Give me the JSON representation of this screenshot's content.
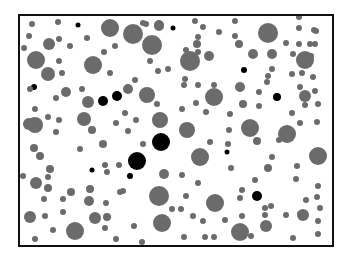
{
  "figure": {
    "frame": {
      "x": 19,
      "y": 15,
      "width": 314,
      "height": 231,
      "stroke": "#111111",
      "stroke_width": 2
    },
    "colors": {
      "gray": "#6b6b6b",
      "black": "#000000",
      "background": "#ffffff"
    },
    "circles": [
      {
        "x": 32,
        "y": 24,
        "r": 3,
        "c": "gray"
      },
      {
        "x": 58,
        "y": 22,
        "r": 3,
        "c": "gray"
      },
      {
        "x": 78,
        "y": 25,
        "r": 2.5,
        "c": "black"
      },
      {
        "x": 110,
        "y": 28,
        "r": 9,
        "c": "gray"
      },
      {
        "x": 133,
        "y": 34,
        "r": 10,
        "c": "gray"
      },
      {
        "x": 146,
        "y": 24,
        "r": 3,
        "c": "gray"
      },
      {
        "x": 159,
        "y": 25,
        "r": 5,
        "c": "gray"
      },
      {
        "x": 173,
        "y": 28,
        "r": 2.5,
        "c": "black"
      },
      {
        "x": 29,
        "y": 36,
        "r": 3,
        "c": "gray"
      },
      {
        "x": 49,
        "y": 44,
        "r": 6,
        "c": "gray"
      },
      {
        "x": 59,
        "y": 39,
        "r": 3,
        "c": "gray"
      },
      {
        "x": 70,
        "y": 46,
        "r": 3,
        "c": "gray"
      },
      {
        "x": 87,
        "y": 38,
        "r": 3,
        "c": "gray"
      },
      {
        "x": 24,
        "y": 48,
        "r": 3,
        "c": "gray"
      },
      {
        "x": 36,
        "y": 60,
        "r": 9,
        "c": "gray"
      },
      {
        "x": 59,
        "y": 61,
        "r": 3,
        "c": "gray"
      },
      {
        "x": 93,
        "y": 65,
        "r": 9,
        "c": "gray"
      },
      {
        "x": 104,
        "y": 52,
        "r": 3,
        "c": "gray"
      },
      {
        "x": 115,
        "y": 46,
        "r": 3,
        "c": "gray"
      },
      {
        "x": 48,
        "y": 74,
        "r": 7,
        "c": "gray"
      },
      {
        "x": 62,
        "y": 73,
        "r": 3,
        "c": "gray"
      },
      {
        "x": 110,
        "y": 73,
        "r": 3,
        "c": "gray"
      },
      {
        "x": 34,
        "y": 87,
        "r": 3,
        "c": "black"
      },
      {
        "x": 30,
        "y": 89,
        "r": 3,
        "c": "gray"
      },
      {
        "x": 66,
        "y": 92,
        "r": 5,
        "c": "gray"
      },
      {
        "x": 82,
        "y": 89,
        "r": 3,
        "c": "gray"
      },
      {
        "x": 56,
        "y": 98,
        "r": 3,
        "c": "gray"
      },
      {
        "x": 88,
        "y": 102,
        "r": 6,
        "c": "gray"
      },
      {
        "x": 103,
        "y": 101,
        "r": 5,
        "c": "black"
      },
      {
        "x": 117,
        "y": 96,
        "r": 5,
        "c": "black"
      },
      {
        "x": 143,
        "y": 23,
        "r": 3,
        "c": "gray"
      },
      {
        "x": 158,
        "y": 71,
        "r": 3,
        "c": "gray"
      },
      {
        "x": 195,
        "y": 21,
        "r": 3,
        "c": "gray"
      },
      {
        "x": 203,
        "y": 27,
        "r": 3,
        "c": "gray"
      },
      {
        "x": 219,
        "y": 32,
        "r": 3,
        "c": "gray"
      },
      {
        "x": 152,
        "y": 45,
        "r": 10,
        "c": "gray"
      },
      {
        "x": 159,
        "y": 26,
        "r": 5,
        "c": "gray"
      },
      {
        "x": 186,
        "y": 50,
        "r": 3,
        "c": "gray"
      },
      {
        "x": 198,
        "y": 52,
        "r": 3,
        "c": "gray"
      },
      {
        "x": 198,
        "y": 37,
        "r": 3,
        "c": "gray"
      },
      {
        "x": 197,
        "y": 44,
        "r": 4,
        "c": "gray"
      },
      {
        "x": 150,
        "y": 61,
        "r": 3,
        "c": "gray"
      },
      {
        "x": 190,
        "y": 61,
        "r": 10,
        "c": "gray"
      },
      {
        "x": 209,
        "y": 56,
        "r": 5,
        "c": "gray"
      },
      {
        "x": 168,
        "y": 69,
        "r": 3,
        "c": "gray"
      },
      {
        "x": 184,
        "y": 85,
        "r": 3,
        "c": "gray"
      },
      {
        "x": 198,
        "y": 85,
        "r": 3,
        "c": "gray"
      },
      {
        "x": 214,
        "y": 85,
        "r": 3,
        "c": "gray"
      },
      {
        "x": 185,
        "y": 79,
        "r": 3,
        "c": "gray"
      },
      {
        "x": 135,
        "y": 80,
        "r": 3,
        "c": "gray"
      },
      {
        "x": 128,
        "y": 89,
        "r": 5,
        "c": "gray"
      },
      {
        "x": 235,
        "y": 21,
        "r": 3,
        "c": "gray"
      },
      {
        "x": 268,
        "y": 33,
        "r": 10,
        "c": "gray"
      },
      {
        "x": 235,
        "y": 36,
        "r": 3,
        "c": "gray"
      },
      {
        "x": 239,
        "y": 44,
        "r": 4,
        "c": "gray"
      },
      {
        "x": 253,
        "y": 54,
        "r": 5,
        "c": "gray"
      },
      {
        "x": 272,
        "y": 54,
        "r": 5,
        "c": "gray"
      },
      {
        "x": 244,
        "y": 70,
        "r": 3,
        "c": "black"
      },
      {
        "x": 272,
        "y": 69,
        "r": 3,
        "c": "gray"
      },
      {
        "x": 267,
        "y": 82,
        "r": 3,
        "c": "gray"
      },
      {
        "x": 240,
        "y": 87,
        "r": 5,
        "c": "gray"
      },
      {
        "x": 259,
        "y": 92,
        "r": 3,
        "c": "gray"
      },
      {
        "x": 299,
        "y": 28,
        "r": 3,
        "c": "gray"
      },
      {
        "x": 299,
        "y": 17,
        "r": 3,
        "c": "gray"
      },
      {
        "x": 316,
        "y": 31,
        "r": 3,
        "c": "gray"
      },
      {
        "x": 299,
        "y": 44,
        "r": 3,
        "c": "gray"
      },
      {
        "x": 310,
        "y": 44,
        "r": 3,
        "c": "gray"
      },
      {
        "x": 314,
        "y": 30,
        "r": 3,
        "c": "gray"
      },
      {
        "x": 305,
        "y": 60,
        "r": 9,
        "c": "gray"
      },
      {
        "x": 286,
        "y": 43,
        "r": 3,
        "c": "gray"
      },
      {
        "x": 293,
        "y": 54,
        "r": 3,
        "c": "gray"
      },
      {
        "x": 311,
        "y": 56,
        "r": 3,
        "c": "gray"
      },
      {
        "x": 315,
        "y": 44,
        "r": 3,
        "c": "gray"
      },
      {
        "x": 268,
        "y": 76,
        "r": 3,
        "c": "gray"
      },
      {
        "x": 292,
        "y": 74,
        "r": 3,
        "c": "gray"
      },
      {
        "x": 302,
        "y": 73,
        "r": 3,
        "c": "gray"
      },
      {
        "x": 315,
        "y": 91,
        "r": 3,
        "c": "gray"
      },
      {
        "x": 313,
        "y": 77,
        "r": 3,
        "c": "gray"
      },
      {
        "x": 305,
        "y": 96,
        "r": 6,
        "c": "gray"
      },
      {
        "x": 292,
        "y": 113,
        "r": 3,
        "c": "gray"
      },
      {
        "x": 300,
        "y": 87,
        "r": 3,
        "c": "gray"
      },
      {
        "x": 243,
        "y": 104,
        "r": 4,
        "c": "gray"
      },
      {
        "x": 259,
        "y": 106,
        "r": 3,
        "c": "gray"
      },
      {
        "x": 230,
        "y": 114,
        "r": 3,
        "c": "gray"
      },
      {
        "x": 250,
        "y": 128,
        "r": 9,
        "c": "gray"
      },
      {
        "x": 215,
        "y": 99,
        "r": 3,
        "c": "gray"
      },
      {
        "x": 277,
        "y": 97,
        "r": 4,
        "c": "black"
      },
      {
        "x": 305,
        "y": 105,
        "r": 3,
        "c": "gray"
      },
      {
        "x": 318,
        "y": 104,
        "r": 3,
        "c": "gray"
      },
      {
        "x": 300,
        "y": 123,
        "r": 3,
        "c": "gray"
      },
      {
        "x": 287,
        "y": 134,
        "r": 9,
        "c": "gray"
      },
      {
        "x": 257,
        "y": 141,
        "r": 4,
        "c": "gray"
      },
      {
        "x": 279,
        "y": 140,
        "r": 3,
        "c": "gray"
      },
      {
        "x": 228,
        "y": 144,
        "r": 3,
        "c": "gray"
      },
      {
        "x": 317,
        "y": 122,
        "r": 3,
        "c": "gray"
      },
      {
        "x": 318,
        "y": 156,
        "r": 9,
        "c": "gray"
      },
      {
        "x": 227,
        "y": 152,
        "r": 2.5,
        "c": "black"
      },
      {
        "x": 231,
        "y": 168,
        "r": 3,
        "c": "gray"
      },
      {
        "x": 255,
        "y": 180,
        "r": 3,
        "c": "gray"
      },
      {
        "x": 268,
        "y": 168,
        "r": 4,
        "c": "gray"
      },
      {
        "x": 272,
        "y": 157,
        "r": 3,
        "c": "gray"
      },
      {
        "x": 296,
        "y": 179,
        "r": 3,
        "c": "gray"
      },
      {
        "x": 297,
        "y": 166,
        "r": 3,
        "c": "gray"
      },
      {
        "x": 318,
        "y": 186,
        "r": 3,
        "c": "gray"
      },
      {
        "x": 317,
        "y": 197,
        "r": 3,
        "c": "gray"
      },
      {
        "x": 257,
        "y": 196,
        "r": 5,
        "c": "black"
      },
      {
        "x": 242,
        "y": 190,
        "r": 3,
        "c": "gray"
      },
      {
        "x": 240,
        "y": 198,
        "r": 3,
        "c": "gray"
      },
      {
        "x": 271,
        "y": 206,
        "r": 3,
        "c": "gray"
      },
      {
        "x": 300,
        "y": 214,
        "r": 3,
        "c": "gray"
      },
      {
        "x": 306,
        "y": 200,
        "r": 3,
        "c": "gray"
      },
      {
        "x": 265,
        "y": 208,
        "r": 3,
        "c": "gray"
      },
      {
        "x": 265,
        "y": 215,
        "r": 3,
        "c": "gray"
      },
      {
        "x": 303,
        "y": 215,
        "r": 6,
        "c": "gray"
      },
      {
        "x": 286,
        "y": 215,
        "r": 3,
        "c": "gray"
      },
      {
        "x": 318,
        "y": 221,
        "r": 3,
        "c": "gray"
      },
      {
        "x": 320,
        "y": 208,
        "r": 3,
        "c": "gray"
      },
      {
        "x": 241,
        "y": 237,
        "r": 3,
        "c": "gray"
      },
      {
        "x": 266,
        "y": 226,
        "r": 6,
        "c": "gray"
      },
      {
        "x": 293,
        "y": 238,
        "r": 3,
        "c": "gray"
      },
      {
        "x": 318,
        "y": 234,
        "r": 3,
        "c": "gray"
      },
      {
        "x": 251,
        "y": 236,
        "r": 3,
        "c": "gray"
      },
      {
        "x": 240,
        "y": 232,
        "r": 9,
        "c": "gray"
      },
      {
        "x": 214,
        "y": 237,
        "r": 3,
        "c": "gray"
      },
      {
        "x": 225,
        "y": 220,
        "r": 3,
        "c": "gray"
      },
      {
        "x": 215,
        "y": 203,
        "r": 9,
        "c": "gray"
      },
      {
        "x": 242,
        "y": 216,
        "r": 3,
        "c": "gray"
      },
      {
        "x": 35,
        "y": 109,
        "r": 3,
        "c": "gray"
      },
      {
        "x": 29,
        "y": 124,
        "r": 6,
        "c": "gray"
      },
      {
        "x": 35,
        "y": 125,
        "r": 8,
        "c": "gray"
      },
      {
        "x": 48,
        "y": 117,
        "r": 3,
        "c": "gray"
      },
      {
        "x": 56,
        "y": 132,
        "r": 3,
        "c": "gray"
      },
      {
        "x": 59,
        "y": 120,
        "r": 3,
        "c": "gray"
      },
      {
        "x": 85,
        "y": 120,
        "r": 3,
        "c": "gray"
      },
      {
        "x": 84,
        "y": 119,
        "r": 7,
        "c": "gray"
      },
      {
        "x": 92,
        "y": 130,
        "r": 4,
        "c": "gray"
      },
      {
        "x": 116,
        "y": 123,
        "r": 3,
        "c": "gray"
      },
      {
        "x": 34,
        "y": 148,
        "r": 4,
        "c": "gray"
      },
      {
        "x": 40,
        "y": 156,
        "r": 4,
        "c": "gray"
      },
      {
        "x": 80,
        "y": 149,
        "r": 3,
        "c": "gray"
      },
      {
        "x": 103,
        "y": 144,
        "r": 4,
        "c": "gray"
      },
      {
        "x": 50,
        "y": 169,
        "r": 4,
        "c": "gray"
      },
      {
        "x": 105,
        "y": 165,
        "r": 3,
        "c": "gray"
      },
      {
        "x": 92,
        "y": 170,
        "r": 2.5,
        "c": "black"
      },
      {
        "x": 119,
        "y": 165,
        "r": 3,
        "c": "gray"
      },
      {
        "x": 147,
        "y": 95,
        "r": 8,
        "c": "gray"
      },
      {
        "x": 125,
        "y": 113,
        "r": 3,
        "c": "gray"
      },
      {
        "x": 136,
        "y": 120,
        "r": 3,
        "c": "gray"
      },
      {
        "x": 128,
        "y": 131,
        "r": 3,
        "c": "gray"
      },
      {
        "x": 157,
        "y": 104,
        "r": 3,
        "c": "gray"
      },
      {
        "x": 160,
        "y": 120,
        "r": 8,
        "c": "gray"
      },
      {
        "x": 187,
        "y": 130,
        "r": 8,
        "c": "gray"
      },
      {
        "x": 214,
        "y": 97,
        "r": 9,
        "c": "gray"
      },
      {
        "x": 182,
        "y": 109,
        "r": 3,
        "c": "gray"
      },
      {
        "x": 196,
        "y": 103,
        "r": 3,
        "c": "gray"
      },
      {
        "x": 206,
        "y": 112,
        "r": 3,
        "c": "gray"
      },
      {
        "x": 143,
        "y": 144,
        "r": 3,
        "c": "gray"
      },
      {
        "x": 161,
        "y": 142,
        "r": 9,
        "c": "black"
      },
      {
        "x": 200,
        "y": 157,
        "r": 9,
        "c": "gray"
      },
      {
        "x": 210,
        "y": 142,
        "r": 3,
        "c": "gray"
      },
      {
        "x": 229,
        "y": 130,
        "r": 3,
        "c": "gray"
      },
      {
        "x": 137,
        "y": 161,
        "r": 9,
        "c": "black"
      },
      {
        "x": 130,
        "y": 176,
        "r": 3,
        "c": "black"
      },
      {
        "x": 164,
        "y": 174,
        "r": 5,
        "c": "gray"
      },
      {
        "x": 182,
        "y": 175,
        "r": 3,
        "c": "gray"
      },
      {
        "x": 198,
        "y": 183,
        "r": 3,
        "c": "gray"
      },
      {
        "x": 123,
        "y": 191,
        "r": 3,
        "c": "gray"
      },
      {
        "x": 159,
        "y": 196,
        "r": 10,
        "c": "gray"
      },
      {
        "x": 186,
        "y": 196,
        "r": 3,
        "c": "gray"
      },
      {
        "x": 172,
        "y": 209,
        "r": 3,
        "c": "gray"
      },
      {
        "x": 181,
        "y": 209,
        "r": 3,
        "c": "gray"
      },
      {
        "x": 162,
        "y": 223,
        "r": 9,
        "c": "gray"
      },
      {
        "x": 134,
        "y": 226,
        "r": 3,
        "c": "gray"
      },
      {
        "x": 193,
        "y": 216,
        "r": 3,
        "c": "gray"
      },
      {
        "x": 203,
        "y": 221,
        "r": 3,
        "c": "gray"
      },
      {
        "x": 184,
        "y": 237,
        "r": 3,
        "c": "gray"
      },
      {
        "x": 205,
        "y": 237,
        "r": 3,
        "c": "gray"
      },
      {
        "x": 142,
        "y": 242,
        "r": 3,
        "c": "gray"
      },
      {
        "x": 23,
        "y": 176,
        "r": 3,
        "c": "gray"
      },
      {
        "x": 36,
        "y": 183,
        "r": 6,
        "c": "gray"
      },
      {
        "x": 48,
        "y": 177,
        "r": 3,
        "c": "gray"
      },
      {
        "x": 48,
        "y": 188,
        "r": 4,
        "c": "gray"
      },
      {
        "x": 44,
        "y": 199,
        "r": 3,
        "c": "gray"
      },
      {
        "x": 63,
        "y": 199,
        "r": 3,
        "c": "gray"
      },
      {
        "x": 71,
        "y": 192,
        "r": 4,
        "c": "gray"
      },
      {
        "x": 90,
        "y": 189,
        "r": 4,
        "c": "gray"
      },
      {
        "x": 89,
        "y": 201,
        "r": 5,
        "c": "gray"
      },
      {
        "x": 106,
        "y": 203,
        "r": 3,
        "c": "gray"
      },
      {
        "x": 120,
        "y": 192,
        "r": 3,
        "c": "gray"
      },
      {
        "x": 30,
        "y": 217,
        "r": 6,
        "c": "gray"
      },
      {
        "x": 45,
        "y": 216,
        "r": 3,
        "c": "gray"
      },
      {
        "x": 63,
        "y": 212,
        "r": 3,
        "c": "gray"
      },
      {
        "x": 95,
        "y": 218,
        "r": 6,
        "c": "gray"
      },
      {
        "x": 107,
        "y": 217,
        "r": 4,
        "c": "gray"
      },
      {
        "x": 105,
        "y": 228,
        "r": 3,
        "c": "gray"
      },
      {
        "x": 53,
        "y": 230,
        "r": 3,
        "c": "gray"
      },
      {
        "x": 75,
        "y": 231,
        "r": 9,
        "c": "gray"
      },
      {
        "x": 35,
        "y": 239,
        "r": 3,
        "c": "gray"
      },
      {
        "x": 116,
        "y": 239,
        "r": 3,
        "c": "gray"
      },
      {
        "x": 107,
        "y": 172,
        "r": 3,
        "c": "gray"
      }
    ]
  }
}
